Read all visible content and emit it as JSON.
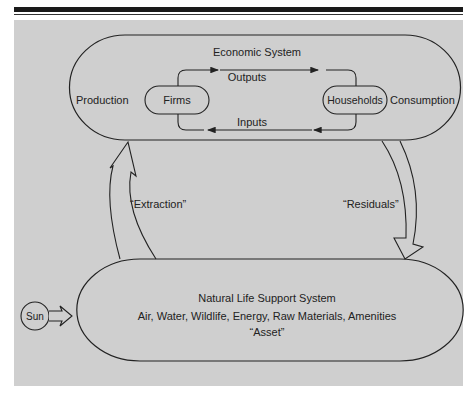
{
  "figure": {
    "economic_system": {
      "title": "Economic System",
      "left_label": "Production",
      "right_label": "Consumption",
      "firms": "Firms",
      "households": "Households",
      "outputs": "Outputs",
      "inputs": "Inputs"
    },
    "flows": {
      "extraction": "“Extraction”",
      "residuals": "“Residuals”"
    },
    "natural_system": {
      "title": "Natural Life Support System",
      "components": "Air, Water, Wildlife, Energy, Raw Materials, Amenities",
      "asset": "“Asset”"
    },
    "sun": "Sun",
    "colors": {
      "panel": "#cfcfcf",
      "stroke": "#222222",
      "bar": "#1a1a1a"
    }
  }
}
